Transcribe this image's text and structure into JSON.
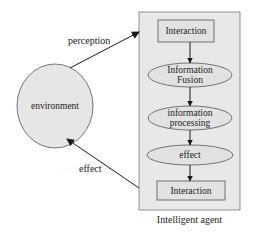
{
  "diagram": {
    "environment": {
      "label": "environment"
    },
    "agent": {
      "caption": "Intelligent agent",
      "nodes": [
        {
          "id": "interaction-top",
          "shape": "rectangle",
          "lines": [
            "Interaction"
          ]
        },
        {
          "id": "information-fusion",
          "shape": "ellipse",
          "lines": [
            "Information",
            "Fusion"
          ]
        },
        {
          "id": "information-processing",
          "shape": "ellipse",
          "lines": [
            "information",
            "processing"
          ]
        },
        {
          "id": "effect-node",
          "shape": "ellipse",
          "lines": [
            "effect"
          ]
        },
        {
          "id": "interaction-bottom",
          "shape": "rectangle",
          "lines": [
            "Interaction"
          ]
        }
      ]
    },
    "edges": {
      "perception": {
        "label": "perception",
        "from": "environment",
        "to": "Intelligent agent"
      },
      "effect": {
        "label": "effect",
        "from": "Intelligent agent",
        "to": "environment"
      }
    },
    "colors": {
      "fill": "#e6e6e6",
      "stroke": "#555555",
      "arrow": "#1a1a1a",
      "background": "#ffffff"
    }
  }
}
